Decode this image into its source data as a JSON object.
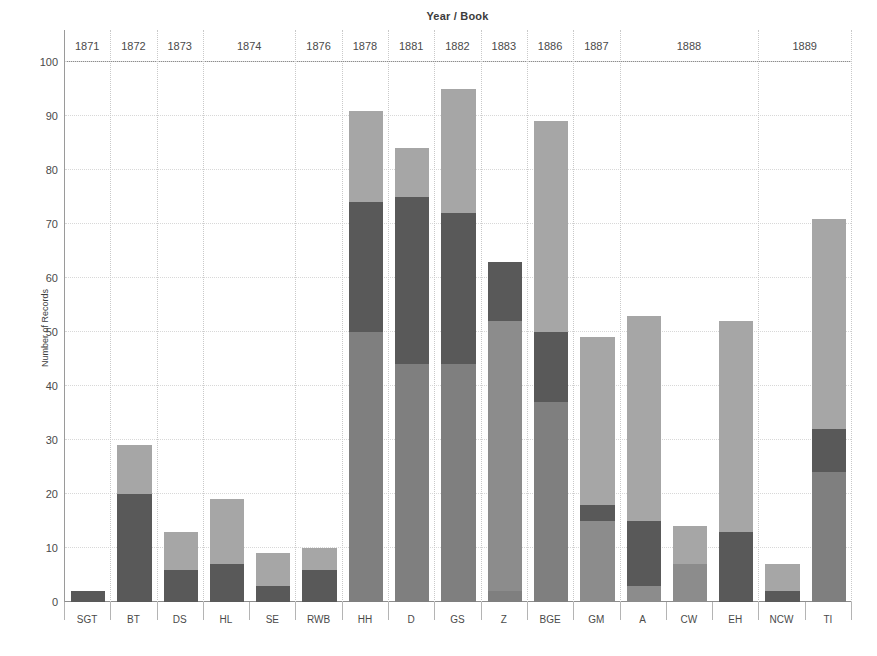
{
  "chart_data": {
    "type": "bar",
    "stacked": true,
    "title": "Year / Book",
    "xlabel": "",
    "ylabel": "Number of Records",
    "ylim": [
      0,
      100
    ],
    "yticks": [
      0,
      10,
      20,
      30,
      40,
      50,
      60,
      70,
      80,
      90,
      100
    ],
    "grid": true,
    "legend": "none",
    "categories": [
      "SGT",
      "BT",
      "DS",
      "HL",
      "SE",
      "RWB",
      "HH",
      "D",
      "GS",
      "Z",
      "BGE",
      "GM",
      "A",
      "CW",
      "EH",
      "NCW",
      "TI"
    ],
    "totals": [
      2,
      29,
      13,
      19,
      9,
      10,
      91,
      84,
      95,
      63,
      89,
      49,
      53,
      14,
      52,
      7,
      71
    ],
    "series": [
      {
        "name": "segment-1",
        "color": "#7f7f7f",
        "values": [
          0,
          0,
          0,
          0,
          0,
          0,
          50,
          44,
          44,
          2,
          37,
          0,
          0,
          0,
          0,
          0,
          24
        ]
      },
      {
        "name": "segment-2",
        "color": "#595959",
        "values": [
          2,
          20,
          6,
          7,
          3,
          6,
          24,
          31,
          28,
          0,
          13,
          15,
          3,
          0,
          0,
          2,
          8
        ]
      },
      {
        "name": "segment-3",
        "color": "#a6a6a6",
        "values": [
          0,
          9,
          7,
          12,
          6,
          4,
          17,
          9,
          23,
          61,
          39,
          2,
          12,
          7,
          13,
          5,
          39
        ]
      },
      {
        "name": "segment-4",
        "color": "#8c8c8c",
        "values": [
          0,
          0,
          0,
          0,
          0,
          0,
          0,
          0,
          0,
          0,
          0,
          32,
          38,
          7,
          39,
          0,
          0
        ]
      }
    ],
    "year_groups": [
      {
        "year": "1871",
        "books": [
          "SGT"
        ]
      },
      {
        "year": "1872",
        "books": [
          "BT"
        ]
      },
      {
        "year": "1873",
        "books": [
          "DS"
        ]
      },
      {
        "year": "1874",
        "books": [
          "HL",
          "SE"
        ]
      },
      {
        "year": "1876",
        "books": [
          "RWB"
        ]
      },
      {
        "year": "1878",
        "books": [
          "HH"
        ]
      },
      {
        "year": "1881",
        "books": [
          "D"
        ]
      },
      {
        "year": "1882",
        "books": [
          "GS"
        ]
      },
      {
        "year": "1883",
        "books": [
          "Z"
        ]
      },
      {
        "year": "1886",
        "books": [
          "BGE"
        ]
      },
      {
        "year": "1887",
        "books": [
          "GM"
        ]
      },
      {
        "year": "1888",
        "books": [
          "A",
          "CW",
          "EH"
        ]
      },
      {
        "year": "1889",
        "books": [
          "NCW",
          "TI"
        ]
      }
    ],
    "bar_stacks": [
      {
        "book": "SGT",
        "segments": [
          {
            "from": 0,
            "to": 2,
            "color": "#595959"
          }
        ]
      },
      {
        "book": "BT",
        "segments": [
          {
            "from": 0,
            "to": 20,
            "color": "#595959"
          },
          {
            "from": 20,
            "to": 29,
            "color": "#a6a6a6"
          }
        ]
      },
      {
        "book": "DS",
        "segments": [
          {
            "from": 0,
            "to": 6,
            "color": "#595959"
          },
          {
            "from": 6,
            "to": 13,
            "color": "#a6a6a6"
          }
        ]
      },
      {
        "book": "HL",
        "segments": [
          {
            "from": 0,
            "to": 7,
            "color": "#595959"
          },
          {
            "from": 7,
            "to": 19,
            "color": "#a6a6a6"
          }
        ]
      },
      {
        "book": "SE",
        "segments": [
          {
            "from": 0,
            "to": 3,
            "color": "#595959"
          },
          {
            "from": 3,
            "to": 9,
            "color": "#a6a6a6"
          }
        ]
      },
      {
        "book": "RWB",
        "segments": [
          {
            "from": 0,
            "to": 6,
            "color": "#595959"
          },
          {
            "from": 6,
            "to": 10,
            "color": "#a6a6a6"
          }
        ]
      },
      {
        "book": "HH",
        "segments": [
          {
            "from": 0,
            "to": 50,
            "color": "#7f7f7f"
          },
          {
            "from": 50,
            "to": 74,
            "color": "#595959"
          },
          {
            "from": 74,
            "to": 91,
            "color": "#a6a6a6"
          }
        ]
      },
      {
        "book": "D",
        "segments": [
          {
            "from": 0,
            "to": 44,
            "color": "#7f7f7f"
          },
          {
            "from": 44,
            "to": 75,
            "color": "#595959"
          },
          {
            "from": 75,
            "to": 84,
            "color": "#a6a6a6"
          }
        ]
      },
      {
        "book": "GS",
        "segments": [
          {
            "from": 0,
            "to": 44,
            "color": "#7f7f7f"
          },
          {
            "from": 44,
            "to": 72,
            "color": "#595959"
          },
          {
            "from": 72,
            "to": 95,
            "color": "#a6a6a6"
          }
        ]
      },
      {
        "book": "Z",
        "segments": [
          {
            "from": 0,
            "to": 2,
            "color": "#7f7f7f"
          },
          {
            "from": 2,
            "to": 52,
            "color": "#8c8c8c"
          },
          {
            "from": 52,
            "to": 63,
            "color": "#595959"
          }
        ]
      },
      {
        "book": "BGE",
        "segments": [
          {
            "from": 0,
            "to": 37,
            "color": "#7f7f7f"
          },
          {
            "from": 37,
            "to": 50,
            "color": "#595959"
          },
          {
            "from": 50,
            "to": 89,
            "color": "#a6a6a6"
          }
        ]
      },
      {
        "book": "GM",
        "segments": [
          {
            "from": 0,
            "to": 15,
            "color": "#8c8c8c"
          },
          {
            "from": 15,
            "to": 18,
            "color": "#595959"
          },
          {
            "from": 18,
            "to": 49,
            "color": "#a6a6a6"
          }
        ]
      },
      {
        "book": "A",
        "segments": [
          {
            "from": 0,
            "to": 3,
            "color": "#8c8c8c"
          },
          {
            "from": 3,
            "to": 15,
            "color": "#595959"
          },
          {
            "from": 15,
            "to": 53,
            "color": "#a6a6a6"
          }
        ]
      },
      {
        "book": "CW",
        "segments": [
          {
            "from": 0,
            "to": 7,
            "color": "#8c8c8c"
          },
          {
            "from": 7,
            "to": 14,
            "color": "#a6a6a6"
          }
        ]
      },
      {
        "book": "EH",
        "segments": [
          {
            "from": 0,
            "to": 13,
            "color": "#595959"
          },
          {
            "from": 13,
            "to": 52,
            "color": "#a6a6a6"
          }
        ]
      },
      {
        "book": "NCW",
        "segments": [
          {
            "from": 0,
            "to": 2,
            "color": "#595959"
          },
          {
            "from": 2,
            "to": 7,
            "color": "#a6a6a6"
          }
        ]
      },
      {
        "book": "TI",
        "segments": [
          {
            "from": 0,
            "to": 24,
            "color": "#7f7f7f"
          },
          {
            "from": 24,
            "to": 32,
            "color": "#595959"
          },
          {
            "from": 32,
            "to": 71,
            "color": "#a6a6a6"
          }
        ]
      }
    ]
  },
  "axis": {
    "y_title": "Number of Records",
    "top_title": "Year / Book"
  }
}
